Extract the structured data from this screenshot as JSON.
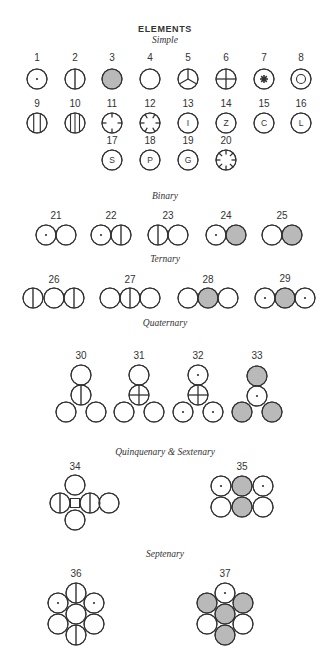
{
  "title": "ELEMENTS",
  "colors": {
    "stroke": "#333333",
    "fill_white": "#ffffff",
    "fill_gray": "#b9b9b9",
    "text": "#333333"
  },
  "radius": 10,
  "sections": [
    {
      "label": "Simple",
      "x": 165,
      "y": 43
    },
    {
      "label": "Binary",
      "x": 165,
      "y": 199
    },
    {
      "label": "Ternary",
      "x": 165,
      "y": 262
    },
    {
      "label": "Quaternary",
      "x": 165,
      "y": 326
    },
    {
      "label": "Quinquenary & Sextenary",
      "x": 165,
      "y": 455
    },
    {
      "label": "Septenary",
      "x": 165,
      "y": 557
    }
  ],
  "elements": [
    {
      "num": "1",
      "nx": 37,
      "ny": 61,
      "circles": [
        {
          "x": 37,
          "y": 79,
          "mark": "dot"
        }
      ]
    },
    {
      "num": "2",
      "nx": 75,
      "ny": 61,
      "circles": [
        {
          "x": 75,
          "y": 79,
          "mark": "vline"
        }
      ]
    },
    {
      "num": "3",
      "nx": 112,
      "ny": 61,
      "circles": [
        {
          "x": 112,
          "y": 79,
          "fill": "gray"
        }
      ]
    },
    {
      "num": "4",
      "nx": 150,
      "ny": 61,
      "circles": [
        {
          "x": 150,
          "y": 79
        }
      ]
    },
    {
      "num": "5",
      "nx": 188,
      "ny": 61,
      "circles": [
        {
          "x": 188,
          "y": 79,
          "mark": "tri"
        }
      ]
    },
    {
      "num": "6",
      "nx": 226,
      "ny": 61,
      "circles": [
        {
          "x": 226,
          "y": 79,
          "mark": "cross"
        }
      ]
    },
    {
      "num": "7",
      "nx": 264,
      "ny": 61,
      "circles": [
        {
          "x": 264,
          "y": 79,
          "mark": "star"
        }
      ]
    },
    {
      "num": "8",
      "nx": 301,
      "ny": 61,
      "circles": [
        {
          "x": 301,
          "y": 79,
          "mark": "ring"
        }
      ]
    },
    {
      "num": "9",
      "nx": 37,
      "ny": 107,
      "circles": [
        {
          "x": 37,
          "y": 123,
          "mark": "vline2"
        }
      ]
    },
    {
      "num": "10",
      "nx": 75,
      "ny": 107,
      "circles": [
        {
          "x": 75,
          "y": 123,
          "mark": "vline3"
        }
      ]
    },
    {
      "num": "11",
      "nx": 112,
      "ny": 107,
      "circles": [
        {
          "x": 112,
          "y": 123,
          "mark": "ticks4"
        }
      ]
    },
    {
      "num": "12",
      "nx": 150,
      "ny": 107,
      "circles": [
        {
          "x": 150,
          "y": 123,
          "mark": "ticks6"
        }
      ]
    },
    {
      "num": "13",
      "nx": 188,
      "ny": 107,
      "circles": [
        {
          "x": 188,
          "y": 123,
          "letter": "I"
        }
      ]
    },
    {
      "num": "14",
      "nx": 226,
      "ny": 107,
      "circles": [
        {
          "x": 226,
          "y": 123,
          "letter": "Z"
        }
      ]
    },
    {
      "num": "15",
      "nx": 264,
      "ny": 107,
      "circles": [
        {
          "x": 264,
          "y": 123,
          "letter": "C"
        }
      ]
    },
    {
      "num": "16",
      "nx": 301,
      "ny": 107,
      "circles": [
        {
          "x": 301,
          "y": 123,
          "letter": "L"
        }
      ]
    },
    {
      "num": "17",
      "nx": 112,
      "ny": 144,
      "circles": [
        {
          "x": 112,
          "y": 160,
          "letter": "S"
        }
      ]
    },
    {
      "num": "18",
      "nx": 150,
      "ny": 144,
      "circles": [
        {
          "x": 150,
          "y": 160,
          "letter": "P"
        }
      ]
    },
    {
      "num": "19",
      "nx": 188,
      "ny": 144,
      "circles": [
        {
          "x": 188,
          "y": 160,
          "letter": "G"
        }
      ]
    },
    {
      "num": "20",
      "nx": 226,
      "ny": 144,
      "circles": [
        {
          "x": 226,
          "y": 160,
          "mark": "ticks8"
        }
      ]
    },
    {
      "num": "21",
      "nx": 56,
      "ny": 219,
      "circles": [
        {
          "x": 46,
          "y": 235,
          "mark": "dot"
        },
        {
          "x": 66,
          "y": 235
        }
      ]
    },
    {
      "num": "22",
      "nx": 111,
      "ny": 219,
      "circles": [
        {
          "x": 101,
          "y": 235,
          "mark": "dot"
        },
        {
          "x": 121,
          "y": 235,
          "mark": "vline"
        }
      ]
    },
    {
      "num": "23",
      "nx": 168,
      "ny": 219,
      "circles": [
        {
          "x": 158,
          "y": 235,
          "mark": "vline"
        },
        {
          "x": 178,
          "y": 235
        }
      ]
    },
    {
      "num": "24",
      "nx": 226,
      "ny": 219,
      "circles": [
        {
          "x": 216,
          "y": 235,
          "mark": "dot"
        },
        {
          "x": 236,
          "y": 235,
          "fill": "gray"
        }
      ]
    },
    {
      "num": "25",
      "nx": 282,
      "ny": 219,
      "circles": [
        {
          "x": 272,
          "y": 235
        },
        {
          "x": 292,
          "y": 235,
          "fill": "gray"
        }
      ]
    },
    {
      "num": "26",
      "nx": 54,
      "ny": 283,
      "circles": [
        {
          "x": 33,
          "y": 298,
          "mark": "vline"
        },
        {
          "x": 54,
          "y": 298
        },
        {
          "x": 74,
          "y": 298,
          "mark": "vline"
        }
      ]
    },
    {
      "num": "27",
      "nx": 130,
      "ny": 283,
      "circles": [
        {
          "x": 110,
          "y": 298
        },
        {
          "x": 130,
          "y": 298,
          "mark": "vline"
        },
        {
          "x": 150,
          "y": 298
        }
      ]
    },
    {
      "num": "28",
      "nx": 208,
      "ny": 283,
      "circles": [
        {
          "x": 188,
          "y": 298
        },
        {
          "x": 208,
          "y": 298,
          "fill": "gray"
        },
        {
          "x": 228,
          "y": 298
        }
      ]
    },
    {
      "num": "29",
      "nx": 285,
      "ny": 282,
      "circles": [
        {
          "x": 265,
          "y": 298,
          "mark": "dot"
        },
        {
          "x": 285,
          "y": 298,
          "fill": "gray"
        },
        {
          "x": 305,
          "y": 298,
          "mark": "dot"
        }
      ]
    },
    {
      "num": "30",
      "nx": 81,
      "ny": 359,
      "circles": [
        {
          "x": 81,
          "y": 375
        },
        {
          "x": 81,
          "y": 395,
          "mark": "vline"
        },
        {
          "x": 66,
          "y": 412
        },
        {
          "x": 96,
          "y": 412
        }
      ]
    },
    {
      "num": "31",
      "nx": 139,
      "ny": 359,
      "circles": [
        {
          "x": 139,
          "y": 375
        },
        {
          "x": 139,
          "y": 395,
          "mark": "cross"
        },
        {
          "x": 124,
          "y": 412
        },
        {
          "x": 154,
          "y": 412
        }
      ]
    },
    {
      "num": "32",
      "nx": 198,
      "ny": 359,
      "circles": [
        {
          "x": 198,
          "y": 375,
          "mark": "dot"
        },
        {
          "x": 198,
          "y": 395,
          "mark": "cross"
        },
        {
          "x": 183,
          "y": 412,
          "mark": "dot"
        },
        {
          "x": 213,
          "y": 412,
          "mark": "dot"
        }
      ]
    },
    {
      "num": "33",
      "nx": 257,
      "ny": 359,
      "circles": [
        {
          "x": 257,
          "y": 376,
          "fill": "gray"
        },
        {
          "x": 257,
          "y": 396,
          "mark": "dot"
        },
        {
          "x": 242,
          "y": 412,
          "fill": "gray"
        },
        {
          "x": 272,
          "y": 412,
          "fill": "gray"
        }
      ]
    },
    {
      "num": "34",
      "nx": 75,
      "ny": 470,
      "circles": [
        {
          "x": 75,
          "y": 485
        },
        {
          "x": 60,
          "y": 503,
          "mark": "vline"
        },
        {
          "x": 90,
          "y": 503,
          "mark": "vline"
        },
        {
          "x": 109,
          "y": 503
        },
        {
          "x": 75,
          "y": 520
        }
      ],
      "center_square": {
        "x": 75,
        "y": 503,
        "size": 9
      }
    },
    {
      "num": "35",
      "nx": 242,
      "ny": 470,
      "circles": [
        {
          "x": 221,
          "y": 486,
          "mark": "dot"
        },
        {
          "x": 242,
          "y": 486,
          "fill": "gray"
        },
        {
          "x": 263,
          "y": 486,
          "mark": "dot"
        },
        {
          "x": 221,
          "y": 507
        },
        {
          "x": 242,
          "y": 507,
          "fill": "gray"
        },
        {
          "x": 263,
          "y": 507
        }
      ]
    },
    {
      "num": "36",
      "nx": 76,
      "ny": 577,
      "circles": [
        {
          "x": 76,
          "y": 593,
          "mark": "vline"
        },
        {
          "x": 58,
          "y": 603,
          "mark": "dot"
        },
        {
          "x": 94,
          "y": 603,
          "mark": "dot"
        },
        {
          "x": 58,
          "y": 624
        },
        {
          "x": 94,
          "y": 624
        },
        {
          "x": 76,
          "y": 635,
          "mark": "vline"
        },
        {
          "x": 76,
          "y": 614
        }
      ]
    },
    {
      "num": "37",
      "nx": 225,
      "ny": 577,
      "circles": [
        {
          "x": 225,
          "y": 593,
          "mark": "dot"
        },
        {
          "x": 207,
          "y": 603,
          "fill": "gray"
        },
        {
          "x": 243,
          "y": 603,
          "fill": "gray"
        },
        {
          "x": 207,
          "y": 624
        },
        {
          "x": 243,
          "y": 624
        },
        {
          "x": 225,
          "y": 635,
          "fill": "gray"
        },
        {
          "x": 225,
          "y": 614,
          "fill": "gray"
        }
      ]
    }
  ]
}
